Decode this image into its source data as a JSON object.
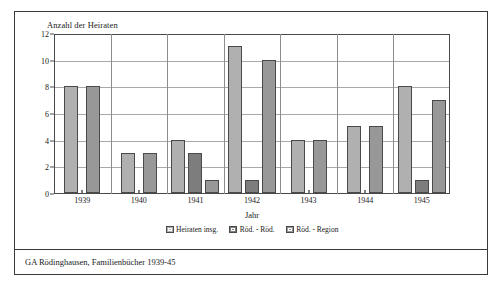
{
  "figure": {
    "caption": "GA Rödinghausen, Familienbücher 1939-45"
  },
  "chart_data": {
    "type": "bar",
    "title": "",
    "ylabel": "Anzahl der Heiraten",
    "xlabel": "Jahr",
    "categories": [
      "1939",
      "1940",
      "1941",
      "1942",
      "1943",
      "1944",
      "1945"
    ],
    "series": [
      {
        "name": "Heiraten insg.",
        "color": "#b0b0b0",
        "values": [
          8,
          3,
          4,
          11,
          4,
          5,
          8
        ]
      },
      {
        "name": "Röd. - Röd.",
        "color": "#7d7d7d",
        "values": [
          0,
          0,
          3,
          1,
          0,
          0,
          1
        ]
      },
      {
        "name": "Röd. - Region",
        "color": "#989898",
        "values": [
          8,
          3,
          1,
          10,
          4,
          5,
          7
        ]
      }
    ],
    "ylim": [
      0,
      12
    ],
    "yticks": [
      0,
      2,
      4,
      6,
      8,
      10,
      12
    ],
    "grid": true,
    "legend_position": "bottom"
  }
}
